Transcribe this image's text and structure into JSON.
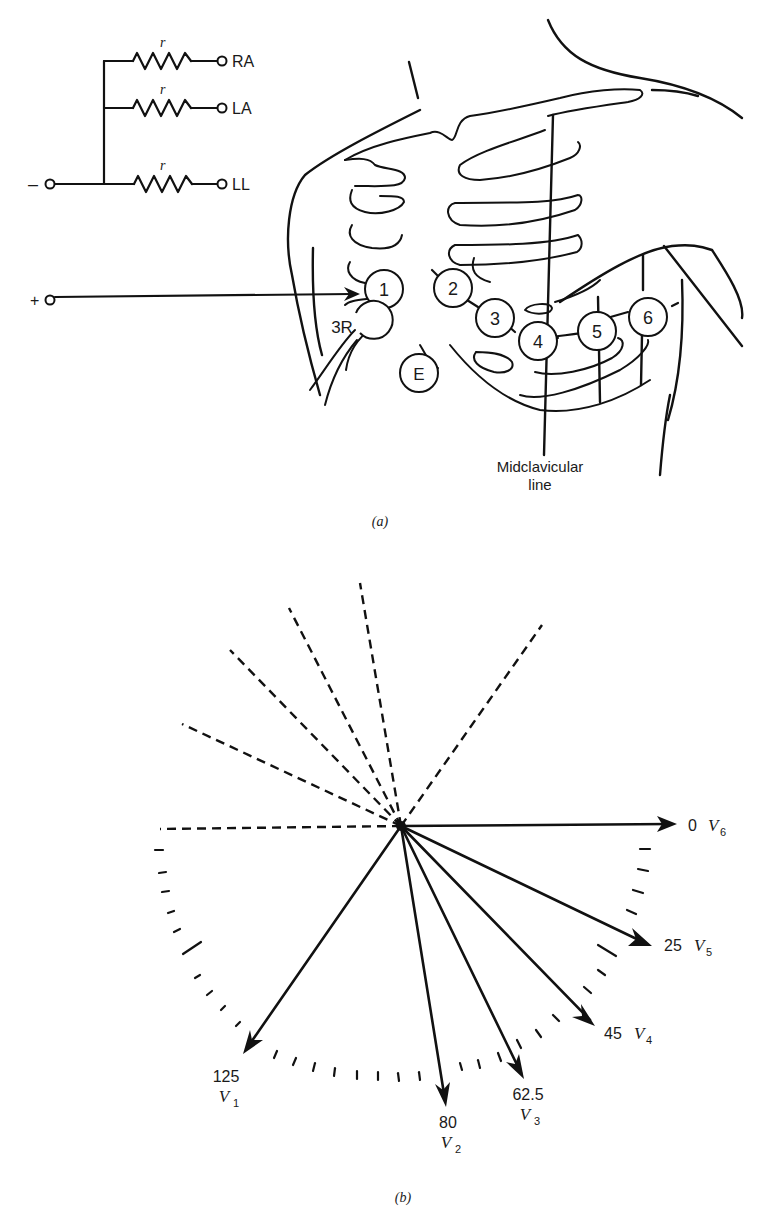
{
  "panel_a": {
    "caption": "(a)",
    "circuit": {
      "negative_terminal": "–",
      "positive_terminal": "+",
      "resistor_label": "r",
      "limb_leads": [
        "RA",
        "LA",
        "LL"
      ]
    },
    "electrodes": [
      {
        "id": "1",
        "label": "1"
      },
      {
        "id": "2",
        "label": "2"
      },
      {
        "id": "3",
        "label": "3"
      },
      {
        "id": "4",
        "label": "4"
      },
      {
        "id": "5",
        "label": "5"
      },
      {
        "id": "6",
        "label": "6"
      },
      {
        "id": "3R",
        "label": "3R"
      },
      {
        "id": "E",
        "label": "E"
      }
    ],
    "midclavicular_label_line1": "Midclavicular",
    "midclavicular_label_line2": "line"
  },
  "panel_b": {
    "caption": "(b)",
    "leads": [
      {
        "name": "V",
        "sub": "6",
        "angle": "0"
      },
      {
        "name": "V",
        "sub": "5",
        "angle": "25"
      },
      {
        "name": "V",
        "sub": "4",
        "angle": "45"
      },
      {
        "name": "V",
        "sub": "3",
        "angle": "62.5"
      },
      {
        "name": "V",
        "sub": "2",
        "angle": "80"
      },
      {
        "name": "V",
        "sub": "1",
        "angle": "125"
      }
    ]
  },
  "colors": {
    "ink": "#111111",
    "background": "#ffffff"
  }
}
